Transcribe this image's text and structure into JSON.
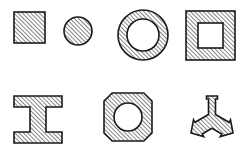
{
  "figure": {
    "background_color": "#ffffff",
    "outline_color": "#1a1a1a",
    "hatch_color": "#2b2b2b",
    "hatch_angle_degrees": 45,
    "hatch_spacing_px": 3,
    "canvas": {
      "width": 250,
      "height": 148
    },
    "rows": 2,
    "columns": 4,
    "shape_count": 8
  },
  "shapes": [
    {
      "id": "solid-square",
      "label": "Solid hatched square",
      "type": "square",
      "filled": "hatched",
      "hollow": false,
      "row": 1,
      "column": 1,
      "bounds": {
        "x": 14,
        "y": 12,
        "width": 31,
        "height": 31
      }
    },
    {
      "id": "solid-circle",
      "label": "Solid hatched circle",
      "type": "circle",
      "filled": "hatched",
      "hollow": false,
      "row": 1,
      "column": 2,
      "center": {
        "x": 78,
        "y": 31
      },
      "radius": 14
    },
    {
      "id": "annulus-ring",
      "label": "Hatched ring (annulus)",
      "type": "annulus",
      "filled": "hatched",
      "hollow": true,
      "row": 1,
      "column": 3,
      "center": {
        "x": 143,
        "y": 35
      },
      "outer_radius": 25,
      "inner_radius": 16
    },
    {
      "id": "hollow-square",
      "label": "Hatched square tube",
      "type": "square-frame",
      "filled": "hatched",
      "hollow": true,
      "row": 1,
      "column": 4,
      "bounds": {
        "x": 186,
        "y": 11,
        "width": 49,
        "height": 49
      },
      "wall_thickness": 12
    },
    {
      "id": "i-beam",
      "label": "Hatched I-beam section",
      "type": "i-beam",
      "filled": "hatched",
      "hollow": false,
      "row": 2,
      "column": 1,
      "bounds": {
        "x": 14,
        "y": 96,
        "width": 48,
        "height": 47
      },
      "flange_thickness": 11,
      "web_width": 16
    },
    {
      "id": "octagon-with-hole",
      "label": "Hatched octagon with circular bore",
      "type": "octagon",
      "filled": "hatched",
      "hollow": true,
      "row": 2,
      "column": 2,
      "center": {
        "x": 128,
        "y": 117
      },
      "outer_radius": 26,
      "inner_radius": 14
    },
    {
      "id": "tripod-y-bracket",
      "label": "Hatched three-legged Y bracket",
      "type": "y-bracket",
      "filled": "hatched",
      "hollow": false,
      "row": 2,
      "column": 3,
      "center": {
        "x": 212,
        "y": 120
      },
      "arm_count": 3,
      "arm_length": 24,
      "arm_width": 8
    }
  ]
}
